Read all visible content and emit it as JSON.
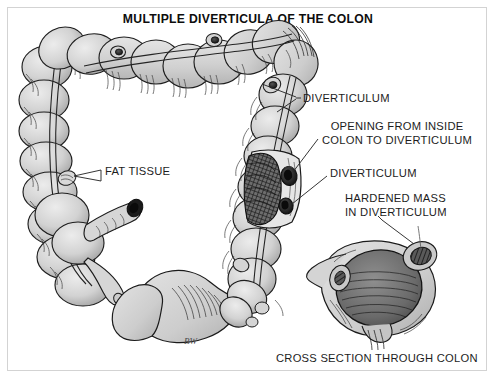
{
  "figure": {
    "title": "MULTIPLE DIVERTICULA OF THE COLON",
    "caption": "CROSS SECTION THROUGH COLON",
    "signature": "BW",
    "style": "pen-and-ink medical illustration, grayscale"
  },
  "labels": {
    "diverticulum_upper": "DIVERTICULUM",
    "opening_from_inside": "OPENING FROM INSIDE\nCOLON TO DIVERTICULUM",
    "diverticulum_lower": "DIVERTICULUM",
    "hardened_mass": "HARDENED MASS\nIN DIVERTICULUM",
    "fat_tissue": "FAT TISSUE"
  },
  "colors": {
    "background": "#ffffff",
    "frame_border": "#d3d3d3",
    "ink": "#1d1d1d",
    "tissue_fill": "#cfcfcf",
    "tissue_fill_light": "#dedede",
    "tissue_shadow": "#9a9a9a",
    "lumen_dark": "#3a3a3a",
    "cavity_black": "#141414"
  }
}
